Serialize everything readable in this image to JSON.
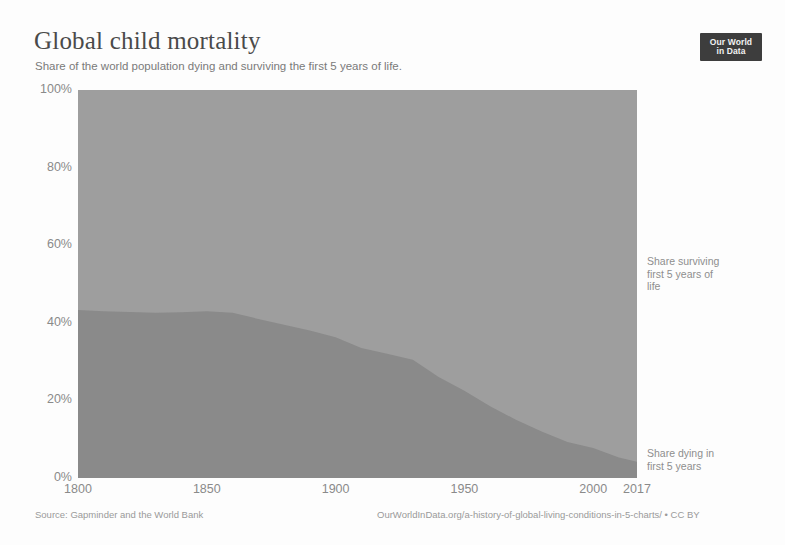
{
  "header": {
    "title": "Global child mortality",
    "subtitle": "Share of the world population dying and surviving the first 5 years of life."
  },
  "logo": {
    "line1": "Our World",
    "line2": "in Data"
  },
  "footer": {
    "source": "Source: Gapminder and the World Bank",
    "license": "OurWorldInData.org/a-history-of-global-living-conditions-in-5-charts/ • CC BY"
  },
  "colors": {
    "surviving": "#9e9e9e",
    "dying": "#8a8a8a",
    "axis_text": "#8a8a8a",
    "title_text": "#4a4a4a",
    "subtitle_text": "#7a7a7a",
    "logo_background": "#3d3d3d",
    "background": "#fdfdfd"
  },
  "chart_data": {
    "type": "area",
    "stacked": true,
    "title": "Global child mortality",
    "subtitle": "Share of the world population dying and surviving the first 5 years of life.",
    "xlabel": "",
    "ylabel": "",
    "xlim": [
      1800,
      2017
    ],
    "ylim": [
      0,
      100
    ],
    "grid": false,
    "legend_position": "right-inline",
    "x_tick_labels": [
      "1800",
      "1850",
      "1900",
      "1950",
      "2000",
      "2017"
    ],
    "x_ticks": [
      1800,
      1850,
      1900,
      1950,
      2000,
      2017
    ],
    "y_tick_labels": [
      "0%",
      "20%",
      "40%",
      "60%",
      "80%",
      "100%"
    ],
    "y_ticks": [
      0,
      20,
      40,
      60,
      80,
      100
    ],
    "x": [
      1800,
      1810,
      1820,
      1830,
      1840,
      1850,
      1860,
      1870,
      1880,
      1890,
      1900,
      1910,
      1920,
      1930,
      1940,
      1950,
      1960,
      1970,
      1980,
      1990,
      2000,
      2010,
      2017
    ],
    "series": [
      {
        "name": "Share dying in first 5 years",
        "label_lines": [
          "Share dying in",
          "first 5 years"
        ],
        "color": "#8a8a8a",
        "values": [
          43.3,
          43.0,
          42.8,
          42.6,
          42.7,
          43.0,
          42.6,
          41.0,
          39.5,
          38.0,
          36.3,
          33.5,
          32.0,
          30.5,
          26.0,
          22.5,
          18.5,
          15.0,
          12.0,
          9.3,
          7.7,
          5.3,
          4.2
        ]
      },
      {
        "name": "Share surviving first 5 years of life",
        "label_lines": [
          "Share surviving",
          "first 5 years of",
          "life"
        ],
        "color": "#9e9e9e",
        "values": [
          56.7,
          57.0,
          57.2,
          57.4,
          57.3,
          57.0,
          57.4,
          59.0,
          60.5,
          62.0,
          63.7,
          66.5,
          68.0,
          69.5,
          74.0,
          77.5,
          81.5,
          85.0,
          88.0,
          90.7,
          92.3,
          94.7,
          95.8
        ]
      }
    ]
  }
}
